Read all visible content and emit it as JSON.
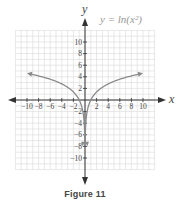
{
  "chart_data": {
    "type": "line",
    "title": "y = ln(x²)",
    "xlabel": "x",
    "ylabel": "y",
    "xlim": [
      -12,
      12
    ],
    "ylim": [
      -12,
      12
    ],
    "grid": true,
    "x_ticks": [
      -10,
      -8,
      -6,
      -4,
      -2,
      2,
      4,
      6,
      8,
      10
    ],
    "y_ticks": [
      10,
      8,
      6,
      4,
      2,
      -2,
      -4,
      -6,
      -8,
      -10
    ],
    "x_tick_labels": [
      "−10",
      "−8",
      "−6",
      "−4",
      "−2",
      "2",
      "4",
      "6",
      "8",
      "10"
    ],
    "y_tick_labels": [
      "10",
      "8",
      "6",
      "4",
      "2",
      "−2",
      "−4",
      "−6",
      "−8",
      "−10"
    ],
    "series": [
      {
        "name": "y = ln(x²)",
        "function": "ln(x^2)",
        "domain": "x != 0",
        "vertical_asymptote": 0,
        "x": [
          -10,
          -8,
          -6,
          -4,
          -2,
          -1,
          -0.5,
          -0.1,
          -0.02,
          0.02,
          0.1,
          0.5,
          1,
          2,
          4,
          6,
          8,
          10
        ],
        "y": [
          4.61,
          4.16,
          3.58,
          2.77,
          1.39,
          0,
          -1.39,
          -4.61,
          -7.82,
          -7.82,
          -4.61,
          -1.39,
          0,
          1.39,
          2.77,
          3.58,
          4.16,
          4.61
        ]
      }
    ],
    "caption": "Figure 11"
  },
  "figure": {
    "title": "y = ln(x²)",
    "x_axis_label": "x",
    "y_axis_label": "y",
    "caption": "Figure 11"
  },
  "colors": {
    "grid": "#d9d9d9",
    "axis": "#333333",
    "curve": "#8a8a8a",
    "title": "#999999",
    "text": "#444444"
  }
}
